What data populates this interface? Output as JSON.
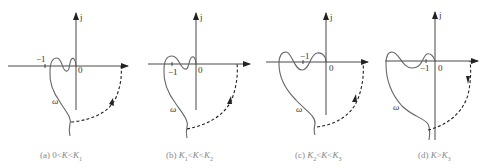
{
  "figure": {
    "panels": [
      {
        "id": "a",
        "caption_prefix": "(a) ",
        "caption": "0<K<K1",
        "cap_parts": [
          "0<",
          "K",
          "<",
          "K",
          "1"
        ],
        "minus_one": "−1",
        "origin": "0",
        "imag": "j",
        "omega": "ω"
      },
      {
        "id": "b",
        "caption_prefix": "(b) ",
        "caption": "K1<K<K2",
        "cap_parts": [
          "K",
          "1",
          "<",
          "K",
          "<",
          "K",
          "2"
        ],
        "minus_one": "−1",
        "origin": "0",
        "imag": "j",
        "omega": "ω"
      },
      {
        "id": "c",
        "caption_prefix": "(c) ",
        "caption": "K2<K<K3",
        "cap_parts": [
          "K",
          "2",
          "<",
          "K",
          "<",
          "K",
          "3"
        ],
        "minus_one": "−1",
        "origin": "0",
        "imag": "j",
        "omega": "ω"
      },
      {
        "id": "d",
        "caption_prefix": "(d) ",
        "caption": "K>K3",
        "cap_parts": [
          "K",
          ">",
          "K",
          "3"
        ],
        "minus_one": "−1",
        "origin": "0",
        "imag": "j",
        "omega": "ω"
      }
    ]
  },
  "colors": {
    "axis": "#333333",
    "curve": "#666666",
    "dashed": "#222222",
    "caption": "#888888"
  }
}
